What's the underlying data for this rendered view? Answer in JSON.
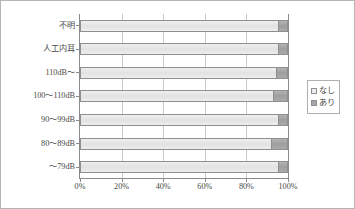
{
  "chart_data": {
    "type": "bar",
    "orientation": "horizontal",
    "stacked": true,
    "normalized_percent": true,
    "title": "",
    "xlabel": "",
    "ylabel": "",
    "xlim": [
      0,
      100
    ],
    "xticks": [
      0,
      20,
      40,
      60,
      80,
      100
    ],
    "xtick_labels": [
      "0%",
      "20%",
      "40%",
      "60%",
      "80%",
      "100%"
    ],
    "grid": true,
    "legend_position": "right",
    "categories": [
      "不明",
      "人工内耳",
      "110dB～",
      "100～110dB",
      "90～99dB",
      "80～89dB",
      "～79dB"
    ],
    "series": [
      {
        "name": "なし",
        "color": "#ededed",
        "values": [
          95,
          95,
          94,
          93,
          95,
          92,
          95
        ]
      },
      {
        "name": "あり",
        "color": "#a6a6a6",
        "values": [
          5,
          5,
          6,
          7,
          5,
          8,
          5
        ]
      }
    ]
  },
  "legend": {
    "items": [
      {
        "label": "なし",
        "swatch": "legend-swatch-nashi"
      },
      {
        "label": "あり",
        "swatch": "legend-swatch-ari"
      }
    ]
  }
}
